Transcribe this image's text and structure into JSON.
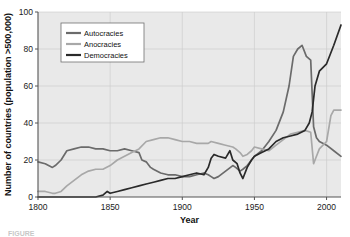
{
  "figure": {
    "caption_fragment": "FIGURE",
    "background": "#ffffff"
  },
  "chart_data": {
    "type": "line",
    "title": "",
    "xlabel": "Year",
    "ylabel": "Number of countries (population >500,000)",
    "xlim": [
      1800,
      2010
    ],
    "ylim": [
      0,
      100
    ],
    "xticks": [
      1800,
      1850,
      1900,
      1950,
      2000
    ],
    "yticks": [
      0,
      20,
      40,
      60,
      80,
      100
    ],
    "grid": true,
    "legend_position": "upper-left",
    "plot_background": "#e9e9e9",
    "grid_color": "#c9c9c9",
    "axis_color": "#555555",
    "series": [
      {
        "name": "Autocracies",
        "color": "#6b6b6b",
        "x": [
          1800,
          1805,
          1810,
          1812,
          1816,
          1820,
          1825,
          1830,
          1835,
          1840,
          1845,
          1850,
          1855,
          1860,
          1865,
          1870,
          1872,
          1875,
          1878,
          1880,
          1885,
          1890,
          1895,
          1900,
          1905,
          1910,
          1915,
          1918,
          1920,
          1922,
          1925,
          1930,
          1935,
          1937,
          1940,
          1942,
          1945,
          1948,
          1950,
          1955,
          1960,
          1965,
          1970,
          1974,
          1977,
          1980,
          1983,
          1986,
          1989,
          1991,
          1993,
          1995,
          2000,
          2005,
          2010
        ],
        "values": [
          19,
          18,
          16,
          17,
          20,
          25,
          26,
          27,
          27,
          26,
          26,
          25,
          25,
          26,
          25,
          24,
          20,
          19,
          16,
          15,
          13,
          12,
          12,
          11,
          11,
          12,
          13,
          12,
          11,
          10,
          11,
          14,
          17,
          16,
          14,
          15,
          17,
          20,
          22,
          25,
          30,
          36,
          46,
          60,
          76,
          80,
          82,
          76,
          74,
          38,
          32,
          30,
          28,
          25,
          22
        ],
        "y_at_2010": 22
      },
      {
        "name": "Anocracies",
        "color": "#a8a8a8",
        "x": [
          1800,
          1805,
          1810,
          1812,
          1816,
          1820,
          1825,
          1830,
          1835,
          1840,
          1845,
          1850,
          1855,
          1860,
          1865,
          1870,
          1875,
          1880,
          1885,
          1890,
          1895,
          1900,
          1905,
          1910,
          1915,
          1918,
          1920,
          1925,
          1930,
          1935,
          1937,
          1940,
          1942,
          1945,
          1948,
          1950,
          1955,
          1960,
          1965,
          1970,
          1975,
          1980,
          1985,
          1989,
          1991,
          1993,
          1995,
          2000,
          2003,
          2005,
          2010
        ],
        "values": [
          3,
          3,
          2,
          2,
          3,
          6,
          9,
          12,
          14,
          15,
          15,
          17,
          20,
          22,
          24,
          26,
          30,
          31,
          32,
          32,
          31,
          30,
          30,
          29,
          29,
          29,
          30,
          29,
          28,
          27,
          26,
          24,
          22,
          23,
          25,
          27,
          26,
          25,
          28,
          31,
          34,
          35,
          36,
          35,
          18,
          22,
          26,
          30,
          44,
          47,
          47
        ],
        "y_at_2010": 47
      },
      {
        "name": "Democracies",
        "color": "#2a2a2a",
        "x": [
          1800,
          1810,
          1820,
          1830,
          1840,
          1845,
          1848,
          1850,
          1855,
          1860,
          1865,
          1870,
          1875,
          1880,
          1885,
          1890,
          1895,
          1900,
          1905,
          1910,
          1915,
          1918,
          1920,
          1922,
          1925,
          1930,
          1933,
          1935,
          1938,
          1940,
          1942,
          1945,
          1948,
          1950,
          1955,
          1960,
          1965,
          1970,
          1975,
          1980,
          1985,
          1988,
          1990,
          1992,
          1995,
          2000,
          2005,
          2010
        ],
        "values": [
          0,
          0,
          0,
          0,
          0,
          1,
          3,
          2,
          3,
          4,
          5,
          6,
          7,
          8,
          9,
          10,
          10,
          11,
          12,
          13,
          12,
          16,
          21,
          23,
          22,
          21,
          25,
          20,
          18,
          13,
          10,
          16,
          20,
          22,
          24,
          26,
          30,
          32,
          33,
          34,
          36,
          40,
          46,
          60,
          68,
          72,
          82,
          93
        ],
        "y_at_2010": 93
      }
    ]
  }
}
